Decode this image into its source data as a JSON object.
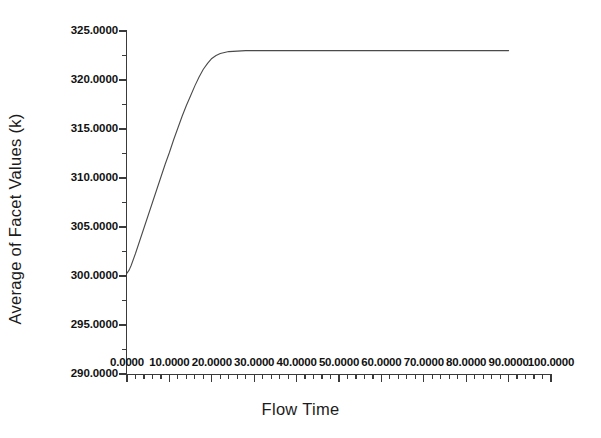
{
  "chart_data": {
    "type": "line",
    "title": "",
    "xlabel": "Flow Time",
    "ylabel": "Average of Facet Values (k)",
    "xlim": [
      0.0,
      100.0
    ],
    "ylim": [
      290.0,
      325.0
    ],
    "xtick_step": 10.0,
    "ytick_step": 5.0,
    "grid": false,
    "legend": null,
    "minor_ticks_per_interval": 5,
    "xticklabels": [
      "0.0000",
      "10.0000",
      "20.0000",
      "30.0000",
      "40.0000",
      "50.0000",
      "60.0000",
      "70.0000",
      "80.0000",
      "90.0000",
      "100.0000"
    ],
    "xtickvalues": [
      0,
      10,
      20,
      30,
      40,
      50,
      60,
      70,
      80,
      90,
      100
    ],
    "yticklabels": [
      "325.0000",
      "320.0000",
      "315.0000",
      "310.0000",
      "305.0000",
      "300.0000",
      "295.0000",
      "290.0000"
    ],
    "ytickvalues": [
      325,
      320,
      315,
      310,
      305,
      300,
      295,
      290
    ],
    "series": [
      {
        "name": "Average of Facet Values",
        "color": "#4a4a4a",
        "x": [
          0.0,
          0.5,
          1.0,
          2.0,
          3.0,
          4.0,
          5.0,
          6.0,
          7.0,
          8.0,
          9.0,
          10.0,
          11.0,
          12.0,
          13.0,
          14.0,
          15.0,
          16.0,
          17.0,
          18.0,
          19.0,
          20.0,
          21.0,
          22.0,
          24.0,
          26.0,
          28.0,
          30.0,
          35.0,
          40.0,
          50.0,
          60.0,
          70.0,
          80.0,
          90.0
        ],
        "y": [
          300.3,
          300.6,
          301.1,
          302.3,
          303.6,
          304.9,
          306.2,
          307.5,
          308.8,
          310.1,
          311.4,
          312.6,
          313.9,
          315.1,
          316.3,
          317.4,
          318.4,
          319.4,
          320.3,
          321.1,
          321.7,
          322.2,
          322.5,
          322.7,
          322.9,
          322.95,
          323.0,
          323.0,
          323.0,
          323.0,
          323.0,
          323.0,
          323.0,
          323.0,
          323.0
        ]
      }
    ]
  },
  "axis_titles": {
    "x": "Flow Time",
    "y": "Average of Facet Values (k)"
  }
}
